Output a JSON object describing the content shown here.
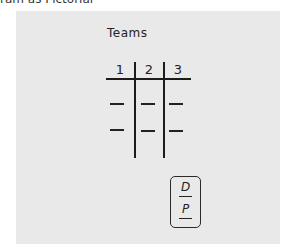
{
  "caption": "ram as Pictorial",
  "diagram": {
    "title": "Teams",
    "columns": [
      "1",
      "2",
      "3"
    ],
    "rows": [
      [
        "—",
        "—",
        "—"
      ],
      [
        "—",
        "—",
        "—"
      ]
    ],
    "legend_box": {
      "top_letter": "D",
      "bottom_letter": "P"
    }
  },
  "colors": {
    "paper": "#e9e9e9",
    "ink": "#1c1c1c"
  }
}
